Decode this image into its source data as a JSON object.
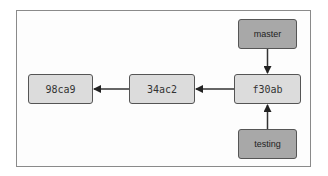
{
  "diagram": {
    "type": "git-branch-graph",
    "commits": [
      {
        "id": "98ca9",
        "x": 28,
        "y": 74,
        "w": 65,
        "h": 30
      },
      {
        "id": "34ac2",
        "x": 129,
        "y": 74,
        "w": 66,
        "h": 30
      },
      {
        "id": "f30ab",
        "x": 234,
        "y": 74,
        "w": 67,
        "h": 30
      }
    ],
    "branches": [
      {
        "name": "master",
        "points_to": "f30ab",
        "x": 238,
        "y": 19,
        "w": 59,
        "h": 30
      },
      {
        "name": "testing",
        "points_to": "f30ab",
        "x": 238,
        "y": 129,
        "w": 59,
        "h": 30
      }
    ],
    "edges": [
      {
        "from": "34ac2",
        "to": "98ca9"
      },
      {
        "from": "f30ab",
        "to": "34ac2"
      },
      {
        "from": "master",
        "to": "f30ab"
      },
      {
        "from": "testing",
        "to": "f30ab"
      }
    ],
    "colors": {
      "commit_fill": "#dcdcdc",
      "branch_fill": "#a8a8a8",
      "border": "#555555",
      "frame": "#8a8a8a"
    }
  }
}
